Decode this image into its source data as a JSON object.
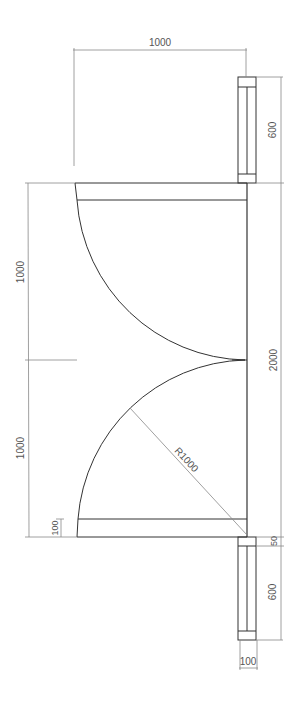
{
  "drawing": {
    "title": "Double swing door plan",
    "colors": {
      "object_line": "#333333",
      "dimension_line": "#888888",
      "text": "#555555",
      "background": "#ffffff"
    },
    "dimensions": {
      "top_width": "1000",
      "top_post_height": "600",
      "left_upper_leaf": "1000",
      "left_lower_leaf": "1000",
      "overall_opening": "2000",
      "panel_thickness": "100",
      "gap": "50",
      "bottom_post_height": "600",
      "post_width": "100",
      "radius": "R1000"
    }
  }
}
